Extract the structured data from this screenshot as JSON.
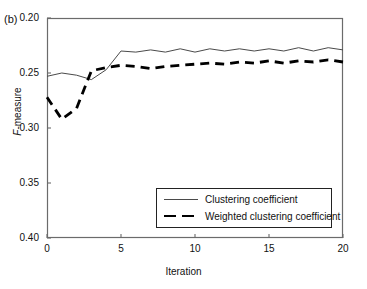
{
  "panel": {
    "label": "(b)"
  },
  "axes": {
    "ylabel_italic": "F",
    "ylabel_rest": "-measure",
    "xlabel": "Iteration",
    "ytick_labels": [
      "0.40",
      "0.35",
      "0.30",
      "0.25",
      "0.20"
    ],
    "xtick_labels": [
      "0",
      "5",
      "10",
      "15",
      "20"
    ]
  },
  "legend": {
    "entries": [
      {
        "label": "Clustering coefficient",
        "style": "solid"
      },
      {
        "label": "Weighted clustering coefficient",
        "style": "dashed"
      }
    ]
  },
  "colors": {
    "solid_line": "#4a4a4a",
    "dashed_line": "#000000",
    "axis": "#6b6b6b",
    "text": "#111111",
    "background": "#ffffff"
  },
  "chart_data": {
    "type": "line",
    "title": "",
    "subtitle": "",
    "panel_label": "(b)",
    "xlabel": "Iteration",
    "ylabel": "F-measure",
    "xlim": [
      0,
      20
    ],
    "ylim": [
      0.2,
      0.4
    ],
    "xticks": [
      0,
      5,
      10,
      15,
      20
    ],
    "yticks": [
      0.2,
      0.25,
      0.3,
      0.35,
      0.4
    ],
    "grid": false,
    "legend_position": "lower-right-inside",
    "x": [
      0,
      1,
      2,
      3,
      4,
      5,
      6,
      7,
      8,
      9,
      10,
      11,
      12,
      13,
      14,
      15,
      16,
      17,
      18,
      19,
      20
    ],
    "series": [
      {
        "name": "Clustering coefficient",
        "style": "solid",
        "values": [
          0.347,
          0.35,
          0.348,
          0.344,
          0.353,
          0.37,
          0.369,
          0.371,
          0.369,
          0.372,
          0.369,
          0.372,
          0.37,
          0.372,
          0.37,
          0.372,
          0.37,
          0.373,
          0.37,
          0.373,
          0.371
        ]
      },
      {
        "name": "Weighted clustering coefficient",
        "style": "dashed",
        "values": [
          0.328,
          0.308,
          0.318,
          0.352,
          0.355,
          0.357,
          0.356,
          0.354,
          0.356,
          0.357,
          0.358,
          0.359,
          0.358,
          0.36,
          0.359,
          0.361,
          0.359,
          0.361,
          0.36,
          0.362,
          0.36
        ]
      }
    ]
  }
}
